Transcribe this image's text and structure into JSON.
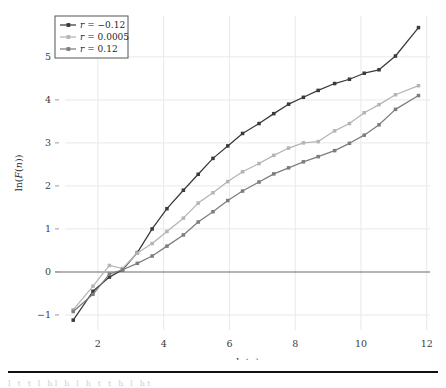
{
  "figure": {
    "background_color": "#ffffff",
    "plot_area": {
      "left": 65,
      "right": 430,
      "top": 16,
      "bottom": 330
    }
  },
  "legend": {
    "position": "top-left",
    "border_color": "#555555",
    "background": "#ffffff",
    "entries": [
      {
        "label": "r = −0.12",
        "var": "r",
        "value": "−0.12",
        "color": "#3a3a3a",
        "marker": "square"
      },
      {
        "label": "r = 0.0005",
        "var": "r",
        "value": "0.0005",
        "color": "#b4b4b4",
        "marker": "square"
      },
      {
        "label": "r = 0.12",
        "var": "r",
        "value": "0.12",
        "color": "#7d7d7d",
        "marker": "square"
      }
    ]
  },
  "bottom_rule": {
    "visible": true,
    "color": "#111111"
  },
  "clipped_text": "l  t  t  l  hl  h  l  h  t  t  h  l  ht",
  "chart_data": {
    "type": "line",
    "title": "",
    "xlabel": "ln(n)",
    "ylabel": "ln(F(n))",
    "xlim": [
      1.0,
      12.1
    ],
    "ylim": [
      -1.35,
      5.95
    ],
    "xticks": [
      2,
      4,
      6,
      8,
      10,
      12
    ],
    "yticks": [
      -1,
      0,
      1,
      2,
      3,
      4,
      5
    ],
    "grid": true,
    "grid_color": "#e8e8e8",
    "zero_line": {
      "y": 0,
      "color": "#6b6b6b"
    },
    "legend_position": "upper-left",
    "markers": true,
    "series": [
      {
        "name": "r = −0.12",
        "color": "#3a3a3a",
        "x": [
          1.25,
          1.85,
          2.35,
          2.75,
          3.2,
          3.65,
          4.1,
          4.6,
          5.05,
          5.5,
          5.95,
          6.4,
          6.9,
          7.35,
          7.8,
          8.25,
          8.7,
          9.2,
          9.65,
          10.1,
          10.55,
          11.05,
          11.75
        ],
        "y": [
          -1.12,
          -0.45,
          -0.12,
          0.05,
          0.45,
          1.0,
          1.47,
          1.9,
          2.27,
          2.64,
          2.93,
          3.22,
          3.45,
          3.68,
          3.9,
          4.06,
          4.22,
          4.38,
          4.48,
          4.62,
          4.7,
          5.02,
          5.68
        ]
      },
      {
        "name": "r = 0.0005",
        "color": "#b4b4b4",
        "x": [
          1.25,
          1.85,
          2.35,
          2.75,
          3.2,
          3.65,
          4.1,
          4.6,
          5.05,
          5.5,
          5.95,
          6.4,
          6.9,
          7.35,
          7.8,
          8.25,
          8.7,
          9.2,
          9.65,
          10.1,
          10.55,
          11.05,
          11.75
        ],
        "y": [
          -0.88,
          -0.33,
          0.15,
          0.08,
          0.44,
          0.66,
          0.94,
          1.25,
          1.6,
          1.84,
          2.1,
          2.33,
          2.52,
          2.71,
          2.88,
          3.0,
          3.03,
          3.28,
          3.45,
          3.7,
          3.89,
          4.12,
          4.33
        ]
      },
      {
        "name": "r = 0.12",
        "color": "#7d7d7d",
        "x": [
          1.25,
          1.85,
          2.35,
          2.75,
          3.2,
          3.65,
          4.1,
          4.6,
          5.05,
          5.5,
          5.95,
          6.4,
          6.9,
          7.35,
          7.8,
          8.25,
          8.7,
          9.2,
          9.65,
          10.1,
          10.55,
          11.05,
          11.75
        ],
        "y": [
          -0.92,
          -0.52,
          -0.05,
          0.05,
          0.2,
          0.37,
          0.6,
          0.86,
          1.16,
          1.4,
          1.66,
          1.88,
          2.09,
          2.28,
          2.42,
          2.56,
          2.68,
          2.82,
          2.99,
          3.18,
          3.42,
          3.78,
          4.1
        ]
      }
    ]
  }
}
